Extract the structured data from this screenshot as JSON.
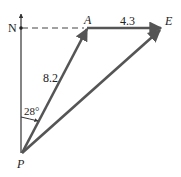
{
  "diagram": {
    "type": "vector-diagram",
    "labels": {
      "north": "N",
      "point_a": "A",
      "point_e": "E",
      "point_p": "P",
      "magnitude_pa": "8.2",
      "magnitude_ae": "4.3",
      "angle": "28°"
    },
    "vectors": [
      {
        "from": "P",
        "to": "A",
        "magnitude": 8.2
      },
      {
        "from": "A",
        "to": "E",
        "magnitude": 4.3
      },
      {
        "from": "P",
        "to": "E",
        "magnitude": null
      }
    ],
    "angle_from_north_deg": 28,
    "colors": {
      "vector": "#555555",
      "axis": "#333333",
      "dashed": "#444444"
    }
  }
}
